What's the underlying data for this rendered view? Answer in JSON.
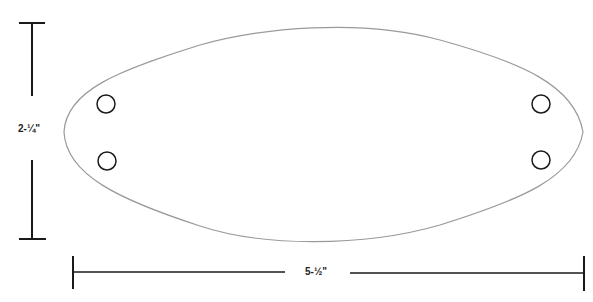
{
  "diagram": {
    "dimensions": {
      "height_label": "2-¼\"",
      "width_label": "5-½\""
    },
    "holes": [
      {
        "name": "top-left",
        "cx": 106,
        "cy": 104
      },
      {
        "name": "bottom-left",
        "cx": 107,
        "cy": 161
      },
      {
        "name": "top-right",
        "cx": 541,
        "cy": 104
      },
      {
        "name": "bottom-right",
        "cx": 541,
        "cy": 160
      }
    ],
    "colors": {
      "outline": "#9a9a9a",
      "ink": "#1a1a1a",
      "background": "#ffffff"
    }
  }
}
